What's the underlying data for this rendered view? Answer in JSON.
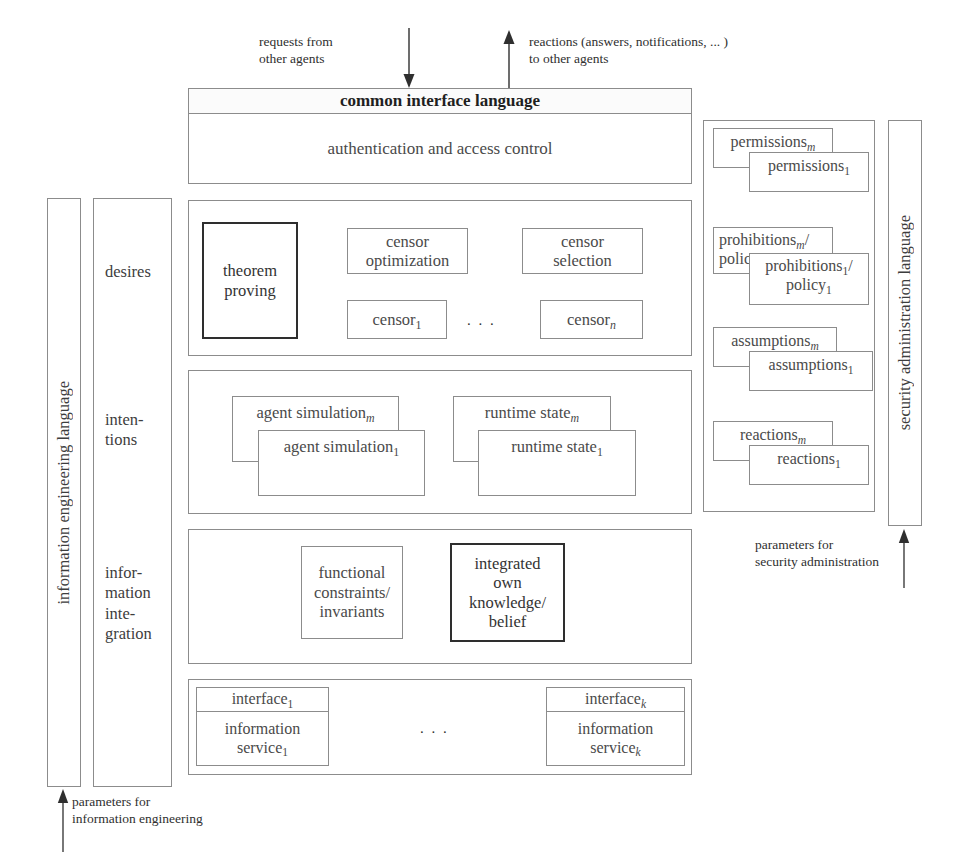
{
  "figure": {
    "background": "#ffffff",
    "line_color": "#8c8c8c",
    "emphasis_color": "#2e2e2e"
  },
  "annotations": {
    "requests_in": "requests from\nother agents",
    "reactions_out": "reactions (answers, notifications, ... )\nto other agents",
    "parameters_information_engineering": "parameters for\ninformation engineering",
    "parameters_security_administration": "parameters for\nsecurity administration"
  },
  "vertical_bars": {
    "left": "information engineering language",
    "right": "security administration language"
  },
  "aspect_column": {
    "items": [
      {
        "label": "desires"
      },
      {
        "label": "inten-\ntions"
      },
      {
        "label": "infor-\nmation\ninte-\ngration"
      }
    ]
  },
  "interface_panel": {
    "header": "common interface language",
    "body": "authentication  and  access control"
  },
  "censor_layer": {
    "boxes": [
      {
        "name": "theorem-proving",
        "label": "theorem\nproving",
        "emphasis": true
      },
      {
        "name": "censor-optimization",
        "label": "censor\noptimization",
        "emphasis": false
      },
      {
        "name": "censor-selection",
        "label": "censor\nselection",
        "emphasis": false
      },
      {
        "name": "censor-1",
        "label": "censor",
        "sub": "1",
        "emphasis": false
      },
      {
        "name": "censor-n",
        "label": "censor",
        "sub": "n",
        "sub_italic": true,
        "emphasis": false
      }
    ],
    "ellipsis": ". . ."
  },
  "simulation_layer": {
    "stacks": [
      {
        "name": "agent-simulation",
        "back": "agent simulation",
        "back_sub": "m",
        "front": "agent simulation",
        "front_sub": "1"
      },
      {
        "name": "runtime-state",
        "back": "runtime state",
        "back_sub": "m",
        "front": "runtime state",
        "front_sub": "1"
      }
    ]
  },
  "integration_layer": {
    "boxes": [
      {
        "name": "functional-constraints",
        "label": "functional\nconstraints/\ninvariants",
        "emphasis": false
      },
      {
        "name": "integrated-own-knowledge",
        "label": "integrated\nown\nknowledge/\nbelief",
        "emphasis": true
      }
    ]
  },
  "service_layer": {
    "services": [
      {
        "name": "service-1",
        "interface": "interface",
        "interface_sub": "1",
        "service": "information\nservice",
        "service_sub": "1"
      },
      {
        "name": "service-k",
        "interface": "interface",
        "interface_sub": "k",
        "service": "information\nservice",
        "service_sub": "k"
      }
    ],
    "ellipsis": ". . ."
  },
  "security_panel": {
    "stacks": [
      {
        "name": "permissions",
        "back": "permissions",
        "back_sub": "m",
        "front": "permissions",
        "front_sub": "1"
      },
      {
        "name": "prohibitions-policy",
        "back": "prohibitions",
        "back_sub": "m",
        "back_tail": "/\npolicy",
        "front": "prohibitions",
        "front_sub": "1",
        "front_tail": "/\npolicy",
        "front_tail_sub": "1"
      },
      {
        "name": "assumptions",
        "back": "assumptions",
        "back_sub": "m",
        "front": "assumptions",
        "front_sub": "1"
      },
      {
        "name": "reactions",
        "back": "reactions",
        "back_sub": "m",
        "front": "reactions",
        "front_sub": "1"
      }
    ]
  }
}
